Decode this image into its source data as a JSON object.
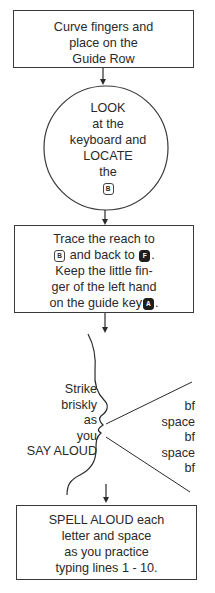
{
  "diagram": {
    "type": "flowchart",
    "colors": {
      "ink": "#2a2a2a",
      "background": "#ffffff",
      "dark_key": "#1e1e1e"
    },
    "step1": {
      "shape": "rectangle",
      "lines": [
        "Curve fingers and",
        "place on the",
        "Guide Row"
      ]
    },
    "step2": {
      "shape": "circle",
      "lines": [
        "LOOK",
        "at the",
        "keyboard and",
        "LOCATE",
        "the"
      ],
      "key": "B"
    },
    "step3": {
      "shape": "rectangle",
      "line1_pre": "Trace the reach to",
      "line2_key1": "B",
      "line2_mid": " and back to ",
      "line2_key2": "F",
      "line2_end": ".",
      "line3": "Keep the little fin-",
      "line4": "ger of the left hand",
      "line5_pre": "on the guide key",
      "line5_key": "A",
      "line5_end": "."
    },
    "step4": {
      "shape": "speaking-profile",
      "left_lines": [
        "Strike",
        "briskly",
        "as",
        "you",
        "SAY ALOUD"
      ],
      "right_lines": [
        "bf",
        "space",
        "bf",
        "space",
        "bf"
      ]
    },
    "step5": {
      "shape": "rectangle",
      "lines": [
        "SPELL ALOUD each",
        "letter and space",
        "as you practice",
        "typing lines 1 - 10."
      ]
    }
  }
}
